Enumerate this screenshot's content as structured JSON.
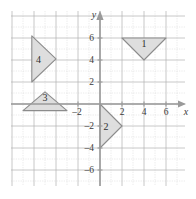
{
  "figure": {
    "type": "coordinate-plane",
    "background_color": "#ffffff",
    "grid": {
      "visible": true,
      "minor_color": "#c8c8c8",
      "major_color": "#b0b0b0",
      "minor_step": 1,
      "major_step": 2,
      "x_min": -8,
      "x_max": 8,
      "y_min": -8,
      "y_max": 8
    },
    "axes": {
      "color": "#9a9a9a",
      "x_axis_label": "x",
      "y_axis_label": "y",
      "x_ticks": [
        -2,
        2,
        4,
        6
      ],
      "y_ticks": [
        6,
        4,
        2,
        -2,
        -4,
        -6
      ],
      "x_tick_labels": [
        "-2",
        "2",
        "4",
        "6"
      ],
      "y_tick_labels": [
        "6",
        "4",
        "2",
        "-2",
        "-4",
        "-6"
      ],
      "origin": [
        0,
        0
      ],
      "unit_px": 11
    },
    "shapes": [
      {
        "label": "1",
        "name": "triangle-1",
        "vertices": [
          [
            2,
            6
          ],
          [
            6,
            6
          ],
          [
            4,
            4
          ]
        ],
        "label_position": [
          4,
          5.5
        ],
        "fill": "#dcdcdc",
        "stroke": "#8c8c8c"
      },
      {
        "label": "2",
        "name": "triangle-2",
        "vertices": [
          [
            0,
            0
          ],
          [
            0,
            -4
          ],
          [
            2,
            -2
          ]
        ],
        "label_position": [
          0.55,
          -2
        ],
        "fill": "#dcdcdc",
        "stroke": "#8c8c8c"
      },
      {
        "label": "3",
        "name": "triangle-3",
        "vertices": [
          [
            -7,
            -0.6
          ],
          [
            -3,
            -0.6
          ],
          [
            -5,
            1.1
          ]
        ],
        "label_position": [
          -5,
          0.6
        ],
        "fill": "#dcdcdc",
        "stroke": "#8c8c8c"
      },
      {
        "label": "4",
        "name": "triangle-4",
        "vertices": [
          [
            -6.2,
            6.2
          ],
          [
            -6.2,
            2.0
          ],
          [
            -4.0,
            4.1
          ]
        ],
        "label_position": [
          -5.6,
          4.1
        ],
        "fill": "#dcdcdc",
        "stroke": "#8c8c8c"
      }
    ]
  }
}
